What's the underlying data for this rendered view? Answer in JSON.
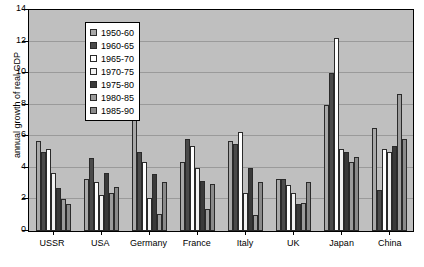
{
  "chart_data": {
    "type": "bar",
    "title": "",
    "xlabel": "",
    "ylabel": "annual growth of real GDP",
    "ylim": [
      0,
      14
    ],
    "ytick_step": 2,
    "yticks": [
      0,
      2,
      4,
      6,
      8,
      10,
      12,
      14
    ],
    "grid": true,
    "legend_position": "top-left inside plot",
    "categories": [
      "USSR",
      "USA",
      "Germany",
      "France",
      "Italy",
      "UK",
      "Japan",
      "China"
    ],
    "series": [
      {
        "name": "1950-60",
        "color": "#a8a8a8",
        "values": [
          5.7,
          3.3,
          7.9,
          4.4,
          5.7,
          3.3,
          8.0,
          6.5
        ]
      },
      {
        "name": "1960-65",
        "color": "#4a4a4a",
        "values": [
          5.0,
          4.6,
          5.0,
          5.8,
          5.5,
          3.3,
          10.0,
          2.6
        ]
      },
      {
        "name": "1965-70",
        "color": "#ffffff",
        "values": [
          5.2,
          3.1,
          4.4,
          5.4,
          6.3,
          2.9,
          12.2,
          5.2
        ]
      },
      {
        "name": "1970-75",
        "color": "#f2f2f2",
        "values": [
          3.7,
          2.3,
          2.1,
          4.0,
          2.4,
          2.4,
          5.2,
          5.0
        ]
      },
      {
        "name": "1975-80",
        "color": "#3a3a3a",
        "values": [
          2.7,
          3.7,
          3.6,
          3.2,
          4.0,
          1.7,
          5.0,
          5.4
        ]
      },
      {
        "name": "1980-85",
        "color": "#9c9c9c",
        "values": [
          2.0,
          2.4,
          1.1,
          1.4,
          1.0,
          1.8,
          4.4,
          8.7
        ]
      },
      {
        "name": "1985-90",
        "color": "#8a8a8a",
        "values": [
          1.7,
          2.8,
          3.1,
          3.0,
          3.1,
          3.1,
          4.7,
          5.8
        ]
      }
    ]
  },
  "legend": {
    "items": [
      {
        "label": "1950-60"
      },
      {
        "label": "1960-65"
      },
      {
        "label": "1965-70"
      },
      {
        "label": "1970-75"
      },
      {
        "label": "1975-80"
      },
      {
        "label": "1980-85"
      },
      {
        "label": "1985-90"
      }
    ]
  }
}
